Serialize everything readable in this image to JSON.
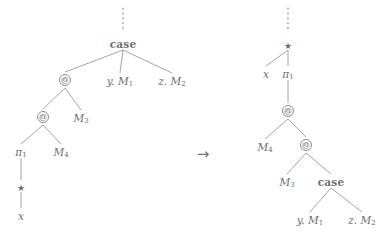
{
  "figure": {
    "caption": "Reduction of a case-expression tree to an application tree",
    "stroke_color": "#9a9a9a",
    "text_color": "#6e6e6e",
    "background": "#ffffff",
    "arrow": {
      "glyph": "→",
      "x": 203,
      "y": 154
    },
    "left_tree": {
      "name": "source-term-tree",
      "vertical_dots": {
        "x": 123,
        "y_top": 8,
        "y_bottom": 30,
        "glyph": "vertical-dots"
      },
      "nodes": [
        {
          "id": "L0",
          "kind": "keyword",
          "label": "case",
          "x": 123,
          "y": 43
        },
        {
          "id": "L1",
          "kind": "app",
          "label": "@",
          "x": 65,
          "y": 80
        },
        {
          "id": "L2",
          "kind": "branch",
          "label": "y. M₁",
          "base": "y.",
          "sub": "1",
          "mid": "M",
          "x": 120,
          "y": 80
        },
        {
          "id": "L3",
          "kind": "branch",
          "label": "z. M₂",
          "base": "z.",
          "sub": "2",
          "mid": "M",
          "x": 172,
          "y": 80
        },
        {
          "id": "L4",
          "kind": "app",
          "label": "@",
          "x": 43,
          "y": 117
        },
        {
          "id": "L5",
          "kind": "term",
          "label": "M₃",
          "mid": "M",
          "sub": "3",
          "x": 81,
          "y": 117
        },
        {
          "id": "L6",
          "kind": "proj",
          "label": "π₁",
          "mid": "π",
          "sub": "1",
          "x": 21,
          "y": 151
        },
        {
          "id": "L7",
          "kind": "term",
          "label": "M₄",
          "mid": "M",
          "sub": "4",
          "x": 61,
          "y": 151
        },
        {
          "id": "L8",
          "kind": "star",
          "label": "★",
          "x": 21,
          "y": 186
        },
        {
          "id": "L9",
          "kind": "var",
          "label": "x",
          "x": 21,
          "y": 215
        }
      ],
      "edges": [
        {
          "from": "L0",
          "to": "L1"
        },
        {
          "from": "L0",
          "to": "L2"
        },
        {
          "from": "L0",
          "to": "L3"
        },
        {
          "from": "L1",
          "to": "L4"
        },
        {
          "from": "L1",
          "to": "L5"
        },
        {
          "from": "L4",
          "to": "L6"
        },
        {
          "from": "L4",
          "to": "L7"
        },
        {
          "from": "L6",
          "to": "L8"
        },
        {
          "from": "L8",
          "to": "L9"
        }
      ]
    },
    "right_tree": {
      "name": "reduced-term-tree",
      "vertical_dots": {
        "x": 288,
        "y_top": 8,
        "y_bottom": 32,
        "glyph": "vertical-dots"
      },
      "nodes": [
        {
          "id": "R0",
          "kind": "star",
          "label": "★",
          "x": 288,
          "y": 44
        },
        {
          "id": "R1",
          "kind": "var",
          "label": "x",
          "x": 266,
          "y": 73
        },
        {
          "id": "R2",
          "kind": "proj",
          "label": "π₁",
          "mid": "π",
          "sub": "1",
          "x": 288,
          "y": 73
        },
        {
          "id": "R3",
          "kind": "app",
          "label": "@",
          "x": 288,
          "y": 111
        },
        {
          "id": "R4",
          "kind": "term",
          "label": "M₄",
          "mid": "M",
          "sub": "4",
          "x": 265,
          "y": 146
        },
        {
          "id": "R5",
          "kind": "app",
          "label": "@",
          "x": 306,
          "y": 145
        },
        {
          "id": "R6",
          "kind": "term",
          "label": "M₃",
          "mid": "M",
          "sub": "3",
          "x": 287,
          "y": 181
        },
        {
          "id": "R7",
          "kind": "keyword",
          "label": "case",
          "x": 331,
          "y": 181
        },
        {
          "id": "R8",
          "kind": "branch",
          "label": "y. M₁",
          "base": "y.",
          "mid": "M",
          "sub": "1",
          "x": 310,
          "y": 219
        },
        {
          "id": "R9",
          "kind": "branch",
          "label": "z. M₂",
          "base": "z.",
          "mid": "M",
          "sub": "2",
          "x": 362,
          "y": 219
        }
      ],
      "edges": [
        {
          "from": "R0",
          "to": "R1"
        },
        {
          "from": "R0",
          "to": "R2"
        },
        {
          "from": "R2",
          "to": "R3"
        },
        {
          "from": "R3",
          "to": "R4"
        },
        {
          "from": "R3",
          "to": "R5"
        },
        {
          "from": "R5",
          "to": "R6"
        },
        {
          "from": "R5",
          "to": "R7"
        },
        {
          "from": "R7",
          "to": "R8"
        },
        {
          "from": "R7",
          "to": "R9"
        }
      ]
    }
  }
}
